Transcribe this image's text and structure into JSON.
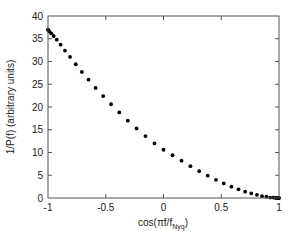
{
  "chart_data": {
    "type": "scatter",
    "title": "",
    "xlabel": "cos(πf/f",
    "xlabel_sub": "Nyq",
    "xlabel_close": ")",
    "ylabel": "1/P(f) (arbitrary units)",
    "xlim": [
      -1,
      1
    ],
    "ylim": [
      0,
      40
    ],
    "grid": false,
    "legend": null,
    "x_ticks": [
      -1,
      -0.5,
      0,
      0.5,
      1
    ],
    "x_tick_labels": [
      "-1",
      "-0.5",
      "0",
      "0.5",
      "1"
    ],
    "y_ticks": [
      0,
      5,
      10,
      15,
      20,
      25,
      30,
      35,
      40
    ],
    "y_tick_labels": [
      "0",
      "5",
      "10",
      "15",
      "20",
      "25",
      "30",
      "35",
      "40"
    ],
    "marker_color": "#000000",
    "series": [
      {
        "name": "1/P(f)",
        "x": [
          1.0,
          0.997,
          0.988,
          0.972,
          0.951,
          0.924,
          0.891,
          0.853,
          0.809,
          0.76,
          0.707,
          0.649,
          0.588,
          0.522,
          0.454,
          0.383,
          0.309,
          0.233,
          0.156,
          0.078,
          0.0,
          -0.078,
          -0.156,
          -0.233,
          -0.309,
          -0.383,
          -0.454,
          -0.522,
          -0.588,
          -0.649,
          -0.707,
          -0.76,
          -0.809,
          -0.853,
          -0.891,
          -0.924,
          -0.951,
          -0.972,
          -0.988,
          -0.997,
          -1.0
        ],
        "y": [
          0.0,
          0.0,
          0.0,
          0.0,
          0.1,
          0.1,
          0.3,
          0.4,
          0.7,
          1.0,
          1.4,
          1.9,
          2.5,
          3.2,
          4.0,
          4.9,
          5.9,
          7.0,
          8.2,
          9.4,
          10.6,
          12.0,
          13.6,
          15.3,
          17.0,
          18.8,
          20.6,
          22.4,
          24.2,
          26.0,
          27.7,
          29.4,
          31.0,
          32.4,
          33.7,
          34.8,
          35.6,
          36.2,
          36.6,
          36.9,
          37.0
        ]
      }
    ]
  }
}
